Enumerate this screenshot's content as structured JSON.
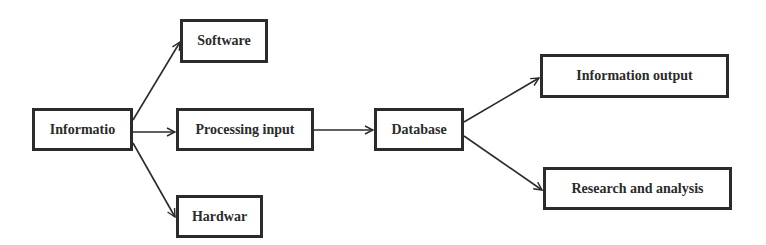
{
  "diagram": {
    "type": "flowchart",
    "colors": {
      "stroke": "#2b2b2b",
      "background": "#ffffff",
      "text": "#2b2b2b"
    },
    "nodes": [
      {
        "id": "informatio",
        "label": "Informatio"
      },
      {
        "id": "software",
        "label": "Software"
      },
      {
        "id": "processing",
        "label": "Processing input"
      },
      {
        "id": "hardwar",
        "label": "Hardwar"
      },
      {
        "id": "database",
        "label": "Database"
      },
      {
        "id": "info_output",
        "label": "Information output"
      },
      {
        "id": "research",
        "label": "Research and analysis"
      }
    ],
    "edges": [
      {
        "from": "informatio",
        "to": "software"
      },
      {
        "from": "informatio",
        "to": "processing"
      },
      {
        "from": "informatio",
        "to": "hardwar"
      },
      {
        "from": "processing",
        "to": "database"
      },
      {
        "from": "database",
        "to": "info_output"
      },
      {
        "from": "database",
        "to": "research"
      }
    ]
  }
}
